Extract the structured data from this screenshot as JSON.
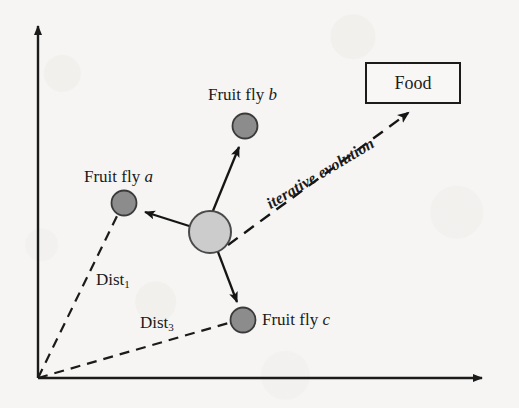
{
  "figure": {
    "kind": "scatter-diagram",
    "background_color": "#f6f5f3",
    "ink_color": "#1b1b1b"
  },
  "axes": {
    "y_axis_name": "vertical-axis",
    "x_axis_name": "horizontal-axis",
    "origin": {
      "x": 38,
      "y": 378
    },
    "y_tip": {
      "x": 38,
      "y": 22
    },
    "x_tip": {
      "x": 490,
      "y": 378
    },
    "tick_labels": [],
    "x_label": "",
    "y_label": ""
  },
  "food": {
    "label": "Food",
    "box": {
      "x": 365,
      "y": 62,
      "width": 92,
      "height": 38
    },
    "border_color": "#1b1b1b"
  },
  "swarm_center": {
    "name": "fruit-fly-swarm-origin",
    "cx": 210,
    "cy": 232,
    "r": 21,
    "fill": "#cccccc",
    "stroke": "#4a4a4a"
  },
  "flies": [
    {
      "id": "a",
      "label_prefix": "Fruit fly ",
      "label_italic": "a",
      "label_x": 84,
      "label_y": 168,
      "cx": 124,
      "cy": 203,
      "r": 12,
      "fill": "#8c8c8c",
      "stroke": "#3a3a3a"
    },
    {
      "id": "b",
      "label_prefix": "Fruit fly ",
      "label_italic": "b",
      "label_x": 208,
      "label_y": 86,
      "cx": 245,
      "cy": 126,
      "r": 12,
      "fill": "#8c8c8c",
      "stroke": "#3a3a3a"
    },
    {
      "id": "c",
      "label_prefix": "Fruit fly ",
      "label_italic": "c",
      "label_x": 262,
      "label_y": 311,
      "cx": 243,
      "cy": 320,
      "r": 12,
      "fill": "#8c8c8c",
      "stroke": "#3a3a3a"
    }
  ],
  "distances": [
    {
      "name": "dist-1",
      "base": "Dist",
      "subscript": "1",
      "label_x": 96,
      "label_y": 271,
      "from": {
        "x": 38,
        "y": 378
      },
      "to": {
        "x": 124,
        "y": 203
      }
    },
    {
      "name": "dist-3",
      "base": "Dist",
      "subscript": "3",
      "label_x": 140,
      "label_y": 314,
      "from": {
        "x": 38,
        "y": 378
      },
      "to": {
        "x": 243,
        "y": 320
      }
    }
  ],
  "evolution": {
    "label": "iterative evolution",
    "from": {
      "x": 228,
      "y": 245
    },
    "to": {
      "x": 412,
      "y": 110
    },
    "style": "dashed-arrow",
    "rotation_deg": -31
  },
  "search_arrows": [
    {
      "name": "arrow-to-fly-a",
      "from": {
        "x": 210,
        "y": 232
      },
      "to": {
        "x": 140,
        "y": 210
      }
    },
    {
      "name": "arrow-to-fly-b",
      "from": {
        "x": 210,
        "y": 232
      },
      "to": {
        "x": 240,
        "y": 142
      }
    },
    {
      "name": "arrow-to-fly-c",
      "from": {
        "x": 210,
        "y": 232
      },
      "to": {
        "x": 238,
        "y": 306
      }
    }
  ]
}
